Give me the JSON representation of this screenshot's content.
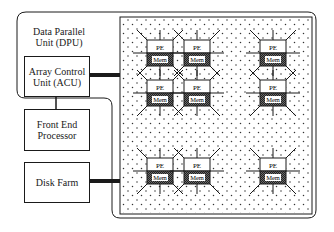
{
  "diagram": {
    "dpu_label": "Data Parallel\nUnit (DPU)",
    "acu_label": "Array Control\nUnit (ACU)",
    "fep_label": "Front End\nProcessor",
    "disk_label": "Disk Farm",
    "pe_label": "PE",
    "mem_label": "Mem",
    "colors": {
      "line": "#1a1a1a",
      "grid_dot": "#333333",
      "mem_fill": "#555555",
      "background": "#ffffff"
    },
    "nodes": [
      {
        "id": "n1",
        "x": 147,
        "y": 40
      },
      {
        "id": "n2",
        "x": 184,
        "y": 40
      },
      {
        "id": "n3",
        "x": 260,
        "y": 40
      },
      {
        "id": "n4",
        "x": 147,
        "y": 80
      },
      {
        "id": "n5",
        "x": 184,
        "y": 80
      },
      {
        "id": "n6",
        "x": 260,
        "y": 80
      },
      {
        "id": "n7",
        "x": 147,
        "y": 158
      },
      {
        "id": "n8",
        "x": 184,
        "y": 158
      },
      {
        "id": "n9",
        "x": 260,
        "y": 158
      }
    ]
  }
}
